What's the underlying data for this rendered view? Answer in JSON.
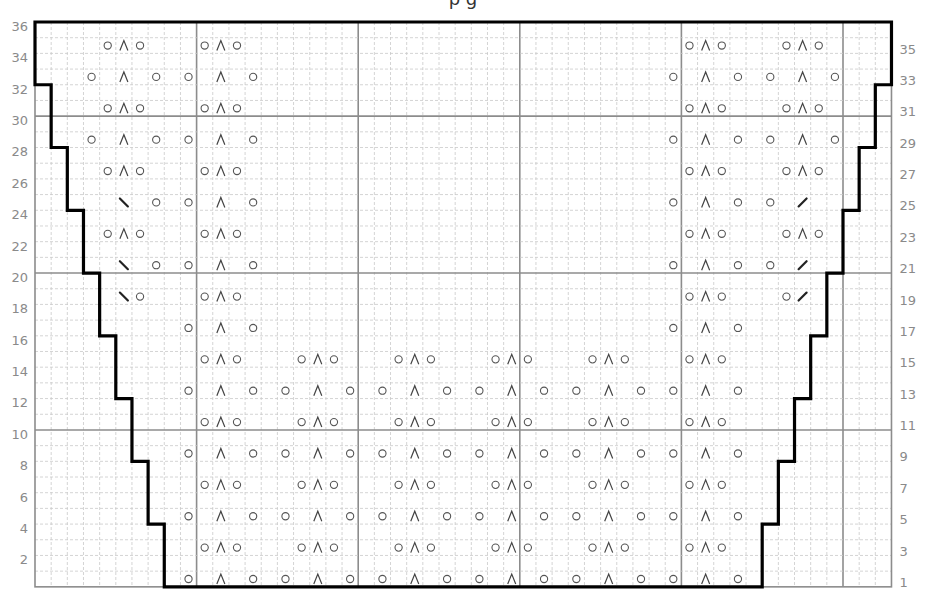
{
  "title_fragment": "p g",
  "grid": {
    "cols": 53,
    "rows": 36,
    "left": 35,
    "top": 22,
    "cell_w": 16.16,
    "cell_h": 15.69,
    "major_every": 10,
    "colors": {
      "minor_line": "#c9c9c9",
      "major_line": "#8c8c8c",
      "outline": "#000000",
      "symbol": "#444444",
      "label": "#8a8a8a"
    }
  },
  "labels": {
    "left_even_rows": [
      36,
      34,
      32,
      30,
      28,
      26,
      24,
      22,
      20,
      18,
      16,
      14,
      12,
      10,
      8,
      6,
      4,
      2
    ],
    "right_odd_rows": [
      35,
      33,
      31,
      29,
      27,
      25,
      23,
      21,
      19,
      17,
      15,
      13,
      11,
      9,
      7,
      5,
      3,
      1
    ]
  },
  "legend_symbols": {
    "o": "yarn over",
    "^": "centered double decrease",
    "\\": "left-slanting decrease",
    "/": "right-slanting decrease"
  },
  "symbol_rows": {
    "35": [
      [
        4,
        "o"
      ],
      [
        5,
        "^"
      ],
      [
        6,
        "o"
      ],
      [
        10,
        "o"
      ],
      [
        11,
        "^"
      ],
      [
        12,
        "o"
      ],
      [
        40,
        "o"
      ],
      [
        41,
        "^"
      ],
      [
        42,
        "o"
      ],
      [
        46,
        "o"
      ],
      [
        47,
        "^"
      ],
      [
        48,
        "o"
      ]
    ],
    "33": [
      [
        3,
        "o"
      ],
      [
        5,
        "^"
      ],
      [
        7,
        "o"
      ],
      [
        9,
        "o"
      ],
      [
        11,
        "^"
      ],
      [
        13,
        "o"
      ],
      [
        39,
        "o"
      ],
      [
        41,
        "^"
      ],
      [
        43,
        "o"
      ],
      [
        45,
        "o"
      ],
      [
        47,
        "^"
      ],
      [
        49,
        "o"
      ]
    ],
    "31": [
      [
        4,
        "o"
      ],
      [
        5,
        "^"
      ],
      [
        6,
        "o"
      ],
      [
        10,
        "o"
      ],
      [
        11,
        "^"
      ],
      [
        12,
        "o"
      ],
      [
        40,
        "o"
      ],
      [
        41,
        "^"
      ],
      [
        42,
        "o"
      ],
      [
        46,
        "o"
      ],
      [
        47,
        "^"
      ],
      [
        48,
        "o"
      ]
    ],
    "29": [
      [
        3,
        "o"
      ],
      [
        5,
        "^"
      ],
      [
        7,
        "o"
      ],
      [
        9,
        "o"
      ],
      [
        11,
        "^"
      ],
      [
        13,
        "o"
      ],
      [
        39,
        "o"
      ],
      [
        41,
        "^"
      ],
      [
        43,
        "o"
      ],
      [
        45,
        "o"
      ],
      [
        47,
        "^"
      ],
      [
        49,
        "o"
      ]
    ],
    "27": [
      [
        4,
        "o"
      ],
      [
        5,
        "^"
      ],
      [
        6,
        "o"
      ],
      [
        10,
        "o"
      ],
      [
        11,
        "^"
      ],
      [
        12,
        "o"
      ],
      [
        40,
        "o"
      ],
      [
        41,
        "^"
      ],
      [
        42,
        "o"
      ],
      [
        46,
        "o"
      ],
      [
        47,
        "^"
      ],
      [
        48,
        "o"
      ]
    ],
    "25": [
      [
        5,
        "\\"
      ],
      [
        7,
        "o"
      ],
      [
        9,
        "o"
      ],
      [
        11,
        "^"
      ],
      [
        13,
        "o"
      ],
      [
        39,
        "o"
      ],
      [
        41,
        "^"
      ],
      [
        43,
        "o"
      ],
      [
        45,
        "o"
      ],
      [
        47,
        "/"
      ]
    ],
    "23": [
      [
        4,
        "o"
      ],
      [
        5,
        "^"
      ],
      [
        6,
        "o"
      ],
      [
        10,
        "o"
      ],
      [
        11,
        "^"
      ],
      [
        12,
        "o"
      ],
      [
        40,
        "o"
      ],
      [
        41,
        "^"
      ],
      [
        42,
        "o"
      ],
      [
        46,
        "o"
      ],
      [
        47,
        "^"
      ],
      [
        48,
        "o"
      ]
    ],
    "21": [
      [
        5,
        "\\"
      ],
      [
        7,
        "o"
      ],
      [
        9,
        "o"
      ],
      [
        11,
        "^"
      ],
      [
        13,
        "o"
      ],
      [
        39,
        "o"
      ],
      [
        41,
        "^"
      ],
      [
        43,
        "o"
      ],
      [
        45,
        "o"
      ],
      [
        47,
        "/"
      ]
    ],
    "19": [
      [
        5,
        "\\"
      ],
      [
        6,
        "o"
      ],
      [
        10,
        "o"
      ],
      [
        11,
        "^"
      ],
      [
        12,
        "o"
      ],
      [
        40,
        "o"
      ],
      [
        41,
        "^"
      ],
      [
        42,
        "o"
      ],
      [
        46,
        "o"
      ],
      [
        47,
        "/"
      ]
    ],
    "17": [
      [
        9,
        "o"
      ],
      [
        11,
        "^"
      ],
      [
        13,
        "o"
      ],
      [
        39,
        "o"
      ],
      [
        41,
        "^"
      ],
      [
        43,
        "o"
      ]
    ],
    "15": [
      [
        10,
        "o"
      ],
      [
        11,
        "^"
      ],
      [
        12,
        "o"
      ],
      [
        16,
        "o"
      ],
      [
        17,
        "^"
      ],
      [
        18,
        "o"
      ],
      [
        22,
        "o"
      ],
      [
        23,
        "^"
      ],
      [
        24,
        "o"
      ],
      [
        28,
        "o"
      ],
      [
        29,
        "^"
      ],
      [
        30,
        "o"
      ],
      [
        34,
        "o"
      ],
      [
        35,
        "^"
      ],
      [
        36,
        "o"
      ],
      [
        40,
        "o"
      ],
      [
        41,
        "^"
      ],
      [
        42,
        "o"
      ]
    ],
    "13": [
      [
        9,
        "o"
      ],
      [
        11,
        "^"
      ],
      [
        13,
        "o"
      ],
      [
        15,
        "o"
      ],
      [
        17,
        "^"
      ],
      [
        19,
        "o"
      ],
      [
        21,
        "o"
      ],
      [
        23,
        "^"
      ],
      [
        25,
        "o"
      ],
      [
        27,
        "o"
      ],
      [
        29,
        "^"
      ],
      [
        31,
        "o"
      ],
      [
        33,
        "o"
      ],
      [
        35,
        "^"
      ],
      [
        37,
        "o"
      ],
      [
        39,
        "o"
      ],
      [
        41,
        "^"
      ],
      [
        43,
        "o"
      ]
    ],
    "11": [
      [
        10,
        "o"
      ],
      [
        11,
        "^"
      ],
      [
        12,
        "o"
      ],
      [
        16,
        "o"
      ],
      [
        17,
        "^"
      ],
      [
        18,
        "o"
      ],
      [
        22,
        "o"
      ],
      [
        23,
        "^"
      ],
      [
        24,
        "o"
      ],
      [
        28,
        "o"
      ],
      [
        29,
        "^"
      ],
      [
        30,
        "o"
      ],
      [
        34,
        "o"
      ],
      [
        35,
        "^"
      ],
      [
        36,
        "o"
      ],
      [
        40,
        "o"
      ],
      [
        41,
        "^"
      ],
      [
        42,
        "o"
      ]
    ],
    "9": [
      [
        9,
        "o"
      ],
      [
        11,
        "^"
      ],
      [
        13,
        "o"
      ],
      [
        15,
        "o"
      ],
      [
        17,
        "^"
      ],
      [
        19,
        "o"
      ],
      [
        21,
        "o"
      ],
      [
        23,
        "^"
      ],
      [
        25,
        "o"
      ],
      [
        27,
        "o"
      ],
      [
        29,
        "^"
      ],
      [
        31,
        "o"
      ],
      [
        33,
        "o"
      ],
      [
        35,
        "^"
      ],
      [
        37,
        "o"
      ],
      [
        39,
        "o"
      ],
      [
        41,
        "^"
      ],
      [
        43,
        "o"
      ]
    ],
    "7": [
      [
        10,
        "o"
      ],
      [
        11,
        "^"
      ],
      [
        12,
        "o"
      ],
      [
        16,
        "o"
      ],
      [
        17,
        "^"
      ],
      [
        18,
        "o"
      ],
      [
        22,
        "o"
      ],
      [
        23,
        "^"
      ],
      [
        24,
        "o"
      ],
      [
        28,
        "o"
      ],
      [
        29,
        "^"
      ],
      [
        30,
        "o"
      ],
      [
        34,
        "o"
      ],
      [
        35,
        "^"
      ],
      [
        36,
        "o"
      ],
      [
        40,
        "o"
      ],
      [
        41,
        "^"
      ],
      [
        42,
        "o"
      ]
    ],
    "5": [
      [
        9,
        "o"
      ],
      [
        11,
        "^"
      ],
      [
        13,
        "o"
      ],
      [
        15,
        "o"
      ],
      [
        17,
        "^"
      ],
      [
        19,
        "o"
      ],
      [
        21,
        "o"
      ],
      [
        23,
        "^"
      ],
      [
        25,
        "o"
      ],
      [
        27,
        "o"
      ],
      [
        29,
        "^"
      ],
      [
        31,
        "o"
      ],
      [
        33,
        "o"
      ],
      [
        35,
        "^"
      ],
      [
        37,
        "o"
      ],
      [
        39,
        "o"
      ],
      [
        41,
        "^"
      ],
      [
        43,
        "o"
      ]
    ],
    "3": [
      [
        10,
        "o"
      ],
      [
        11,
        "^"
      ],
      [
        12,
        "o"
      ],
      [
        16,
        "o"
      ],
      [
        17,
        "^"
      ],
      [
        18,
        "o"
      ],
      [
        22,
        "o"
      ],
      [
        23,
        "^"
      ],
      [
        24,
        "o"
      ],
      [
        28,
        "o"
      ],
      [
        29,
        "^"
      ],
      [
        30,
        "o"
      ],
      [
        34,
        "o"
      ],
      [
        35,
        "^"
      ],
      [
        36,
        "o"
      ],
      [
        40,
        "o"
      ],
      [
        41,
        "^"
      ],
      [
        42,
        "o"
      ]
    ],
    "1": [
      [
        9,
        "o"
      ],
      [
        11,
        "^"
      ],
      [
        13,
        "o"
      ],
      [
        15,
        "o"
      ],
      [
        17,
        "^"
      ],
      [
        19,
        "o"
      ],
      [
        21,
        "o"
      ],
      [
        23,
        "^"
      ],
      [
        25,
        "o"
      ],
      [
        27,
        "o"
      ],
      [
        29,
        "^"
      ],
      [
        31,
        "o"
      ],
      [
        33,
        "o"
      ],
      [
        35,
        "^"
      ],
      [
        37,
        "o"
      ],
      [
        39,
        "o"
      ],
      [
        41,
        "^"
      ],
      [
        43,
        "o"
      ]
    ]
  },
  "outline_steps": {
    "left": [
      {
        "rows": [
          33,
          36
        ],
        "col": 0
      },
      {
        "rows": [
          29,
          32
        ],
        "col": 1
      },
      {
        "rows": [
          25,
          28
        ],
        "col": 2
      },
      {
        "rows": [
          21,
          24
        ],
        "col": 3
      },
      {
        "rows": [
          17,
          20
        ],
        "col": 4
      },
      {
        "rows": [
          13,
          16
        ],
        "col": 5
      },
      {
        "rows": [
          9,
          12
        ],
        "col": 6
      },
      {
        "rows": [
          5,
          8
        ],
        "col": 7
      },
      {
        "rows": [
          1,
          4
        ],
        "col": 8
      }
    ],
    "right": [
      {
        "rows": [
          33,
          36
        ],
        "col": 53
      },
      {
        "rows": [
          29,
          32
        ],
        "col": 52
      },
      {
        "rows": [
          25,
          28
        ],
        "col": 51
      },
      {
        "rows": [
          21,
          24
        ],
        "col": 50
      },
      {
        "rows": [
          17,
          20
        ],
        "col": 49
      },
      {
        "rows": [
          13,
          16
        ],
        "col": 48
      },
      {
        "rows": [
          9,
          12
        ],
        "col": 47
      },
      {
        "rows": [
          5,
          8
        ],
        "col": 46
      },
      {
        "rows": [
          1,
          4
        ],
        "col": 45
      }
    ]
  }
}
